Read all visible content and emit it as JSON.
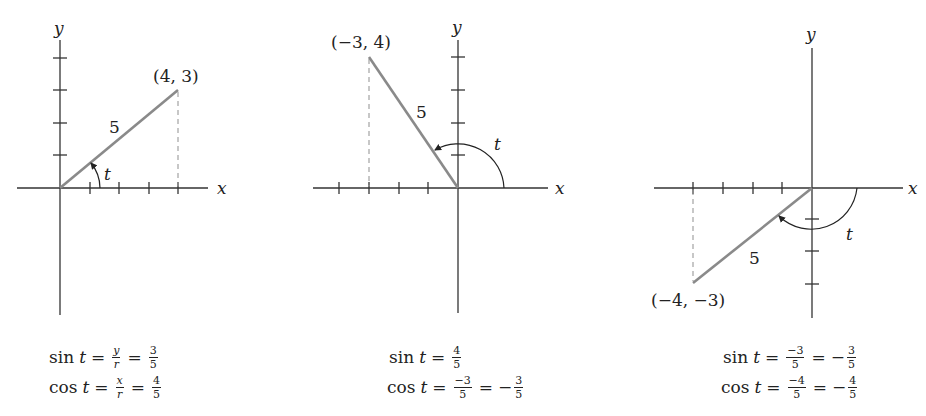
{
  "panels": [
    {
      "point_label": "(4, 3)",
      "radius_label": "5",
      "angle_label": "t",
      "x_axis_label": "x",
      "y_axis_label": "y",
      "point": [
        4,
        3
      ],
      "quadrant": "I",
      "sin": {
        "prefix": "sin",
        "var": "t",
        "eq": "=",
        "f1_num": "y",
        "f1_den": "r",
        "f2_num": "3",
        "f2_den": "5"
      },
      "cos": {
        "prefix": "cos",
        "var": "t",
        "eq": "=",
        "f1_num": "x",
        "f1_den": "r",
        "f2_num": "4",
        "f2_den": "5"
      }
    },
    {
      "point_label": "(−3, 4)",
      "radius_label": "5",
      "angle_label": "t",
      "x_axis_label": "x",
      "y_axis_label": "y",
      "point": [
        -3,
        4
      ],
      "quadrant": "II",
      "sin": {
        "prefix": "sin",
        "var": "t",
        "eq": "=",
        "f1_num": "4",
        "f1_den": "5"
      },
      "cos": {
        "prefix": "cos",
        "var": "t",
        "eq": "=",
        "f1_num": "−3",
        "f1_den": "5",
        "neg": "−",
        "f2_num": "3",
        "f2_den": "5"
      }
    },
    {
      "point_label": "(−4, −3)",
      "radius_label": "5",
      "angle_label": "t",
      "x_axis_label": "x",
      "y_axis_label": "y",
      "point": [
        -4,
        -3
      ],
      "quadrant": "III",
      "sin": {
        "prefix": "sin",
        "var": "t",
        "eq": "=",
        "f1_num": "−3",
        "f1_den": "5",
        "neg": "−",
        "f2_num": "3",
        "f2_den": "5"
      },
      "cos": {
        "prefix": "cos",
        "var": "t",
        "eq": "=",
        "f1_num": "−4",
        "f1_den": "5",
        "neg": "−",
        "f2_num": "4",
        "f2_den": "5"
      }
    }
  ],
  "colors": {
    "axis": "#333333",
    "radius": "#8a8a8a",
    "dashed": "#9a9a9a",
    "text": "#222222"
  }
}
